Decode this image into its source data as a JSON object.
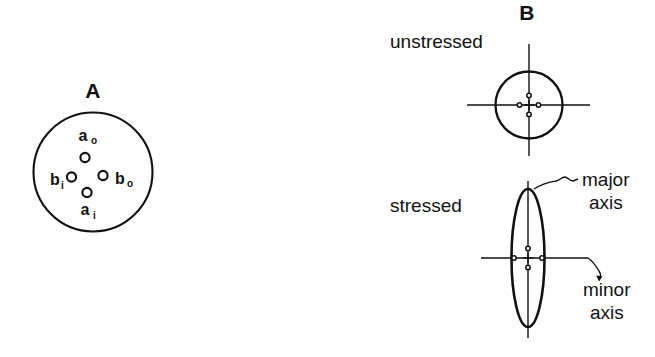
{
  "figure": {
    "background_color": "#ffffff",
    "ink_color": "#111111",
    "panels": [
      {
        "id": "A",
        "letter": "A",
        "description": "cross-section disc with four holes",
        "holes": [
          {
            "name": "a-outer",
            "label_base": "a",
            "label_sub": "o",
            "position": "top"
          },
          {
            "name": "b-inner",
            "label_base": "b",
            "label_sub": "i",
            "position": "left"
          },
          {
            "name": "b-outer",
            "label_base": "b",
            "label_sub": "o",
            "position": "right"
          },
          {
            "name": "a-inner",
            "label_base": "a",
            "label_sub": "i",
            "position": "bottom"
          }
        ]
      },
      {
        "id": "B",
        "letter": "B",
        "states": [
          {
            "name": "unstressed",
            "label": "unstressed",
            "shape": "circle"
          },
          {
            "name": "stressed",
            "label": "stressed",
            "shape": "ellipse"
          }
        ],
        "annotations": [
          {
            "name": "major-axis",
            "line1": "major",
            "line2": "axis"
          },
          {
            "name": "minor-axis",
            "line1": "minor",
            "line2": "axis"
          }
        ]
      }
    ]
  },
  "panel_a": {
    "letter": "A",
    "labels": {
      "a_outer_base": "a",
      "a_outer_sub": "o",
      "b_inner_base": "b",
      "b_inner_sub": "i",
      "b_outer_base": "b",
      "b_outer_sub": "o",
      "a_inner_base": "a",
      "a_inner_sub": "i"
    }
  },
  "panel_b": {
    "letter": "B",
    "unstressed_label": "unstressed",
    "stressed_label": "stressed",
    "major_axis_line1": "major",
    "major_axis_line2": "axis",
    "minor_axis_line1": "minor",
    "minor_axis_line2": "axis"
  }
}
